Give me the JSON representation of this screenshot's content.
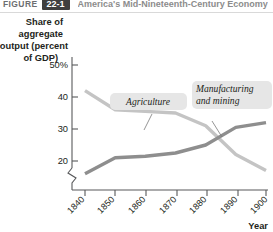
{
  "header": {
    "figure_word": "FIGURE",
    "figure_number": "22-1",
    "figure_title": "America's Mid-Nineteenth-Century Economy"
  },
  "chart_data": {
    "type": "line",
    "title": "",
    "xlabel": "Year",
    "ylabel": "Share of aggregate output (percent of GDP)",
    "x": [
      1840,
      1850,
      1860,
      1870,
      1880,
      1890,
      1900
    ],
    "xticklabels": [
      "1840",
      "1850",
      "1860",
      "1870",
      "1880",
      "1890",
      "1900"
    ],
    "yticklabels": [
      "50%",
      "40",
      "30",
      "20"
    ],
    "yticks": [
      50,
      40,
      30,
      20
    ],
    "ylim": [
      15,
      52
    ],
    "xlim": [
      1840,
      1900
    ],
    "y_axis_break": true,
    "grid": false,
    "legend": "inline-callouts",
    "series": [
      {
        "name": "Agriculture",
        "color": "#c4c4c4",
        "values": [
          42,
          36,
          35.5,
          35,
          31,
          22,
          17
        ],
        "label": "Agriculture",
        "label_x": 152,
        "label_y": 92
      },
      {
        "name": "Manufacturing and mining",
        "color": "#8e8e8e",
        "values": [
          16,
          21,
          21.5,
          22.5,
          25,
          30.5,
          32
        ],
        "label": "Manufacturing and mining",
        "label_line_1": "Manufacturing",
        "label_line_2": "and mining",
        "label_x": 235,
        "label_y": 92
      }
    ],
    "ylabel_lines": [
      "Share of",
      "aggregate",
      "output (percent",
      "of GDP)"
    ]
  }
}
